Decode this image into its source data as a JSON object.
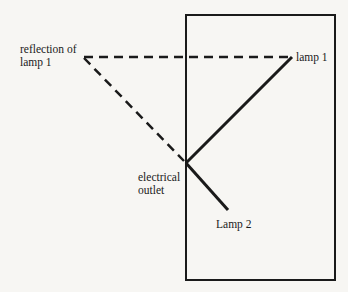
{
  "diagram": {
    "type": "mirror-reflection-ray-diagram",
    "labels": {
      "reflection": "reflection of",
      "reflection_line2": "lamp 1",
      "lamp1": "lamp 1",
      "outlet_line1": "electrical",
      "outlet_line2": "outlet",
      "lamp2": "Lamp 2"
    },
    "colors": {
      "ink": "#1a1a1a",
      "background": "#f7f6f3"
    },
    "points": {
      "reflection_of_lamp1": [
        82,
        57
      ],
      "lamp1": [
        292,
        57
      ],
      "electrical_outlet": [
        186,
        163
      ],
      "lamp2": [
        228,
        210
      ]
    },
    "room": {
      "x": 186,
      "y": 15,
      "width": 149,
      "height": 265
    }
  }
}
